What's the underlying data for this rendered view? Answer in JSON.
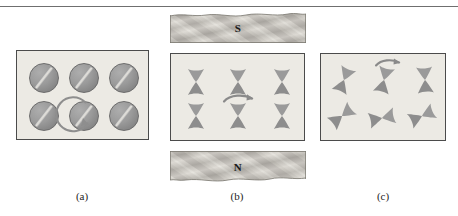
{
  "figure": {
    "background_color": "#ffffff",
    "panel_fill": "#eceae4",
    "panel_border": "#4b4b4b",
    "element_color": "#8a8a8a",
    "rule_color": "#6f6f6f"
  },
  "captions": {
    "a": "(a)",
    "b": "(b)",
    "c": "(c)"
  },
  "panel_a": {
    "name": "discs-panel",
    "disc_count": 6,
    "discs": [
      {
        "label": "disc-1",
        "x": 12,
        "y": 12,
        "slot_angle": -52
      },
      {
        "label": "disc-2",
        "x": 52,
        "y": 12,
        "slot_angle": -52
      },
      {
        "label": "disc-3",
        "x": 92,
        "y": 12,
        "slot_angle": -52
      },
      {
        "label": "disc-4",
        "x": 12,
        "y": 50,
        "slot_angle": -52
      },
      {
        "label": "disc-5",
        "x": 52,
        "y": 50,
        "slot_angle": -52
      },
      {
        "label": "disc-6",
        "x": 92,
        "y": 50,
        "slot_angle": -52
      }
    ],
    "rotation_arrow": {
      "label": "rotation-arrow",
      "target_disc": "disc-5",
      "direction": "clockwise"
    }
  },
  "panel_b": {
    "name": "aligned-dipoles-panel",
    "shape_count": 6,
    "shapes": [
      {
        "label": "dipole-1",
        "x": 14,
        "y": 14,
        "angle": 0
      },
      {
        "label": "dipole-2",
        "x": 56,
        "y": 14,
        "angle": 0
      },
      {
        "label": "dipole-3",
        "x": 100,
        "y": 14,
        "angle": 0
      },
      {
        "label": "dipole-4",
        "x": 14,
        "y": 48,
        "angle": 0
      },
      {
        "label": "dipole-5",
        "x": 56,
        "y": 48,
        "angle": 0
      },
      {
        "label": "dipole-6",
        "x": 100,
        "y": 48,
        "angle": 0
      }
    ],
    "rotation_arrow": {
      "label": "rotation-arrow",
      "target_shape": "dipole-5",
      "direction": "counter-clockwise"
    }
  },
  "panel_c": {
    "name": "random-dipoles-panel",
    "shape_count": 6,
    "shapes": [
      {
        "label": "dipole-1",
        "x": 12,
        "y": 12,
        "angle": 22
      },
      {
        "label": "dipole-2",
        "x": 52,
        "y": 12,
        "angle": 14
      },
      {
        "label": "dipole-3",
        "x": 93,
        "y": 12,
        "angle": -4
      },
      {
        "label": "dipole-4",
        "x": 10,
        "y": 48,
        "angle": 52
      },
      {
        "label": "dipole-5",
        "x": 50,
        "y": 50,
        "angle": 78
      },
      {
        "label": "dipole-6",
        "x": 90,
        "y": 48,
        "angle": 66
      }
    ],
    "rotation_arrow": {
      "label": "rotation-arrow",
      "target_shape": "dipole-2",
      "direction": "counter-clockwise"
    }
  },
  "magnet": {
    "pole_south": {
      "label": "S",
      "name": "south-pole-piece",
      "position": "top",
      "texture": "diagonal-hatched"
    },
    "pole_north": {
      "label": "N",
      "name": "north-pole-piece",
      "position": "bottom",
      "texture": "diagonal-hatched"
    }
  }
}
